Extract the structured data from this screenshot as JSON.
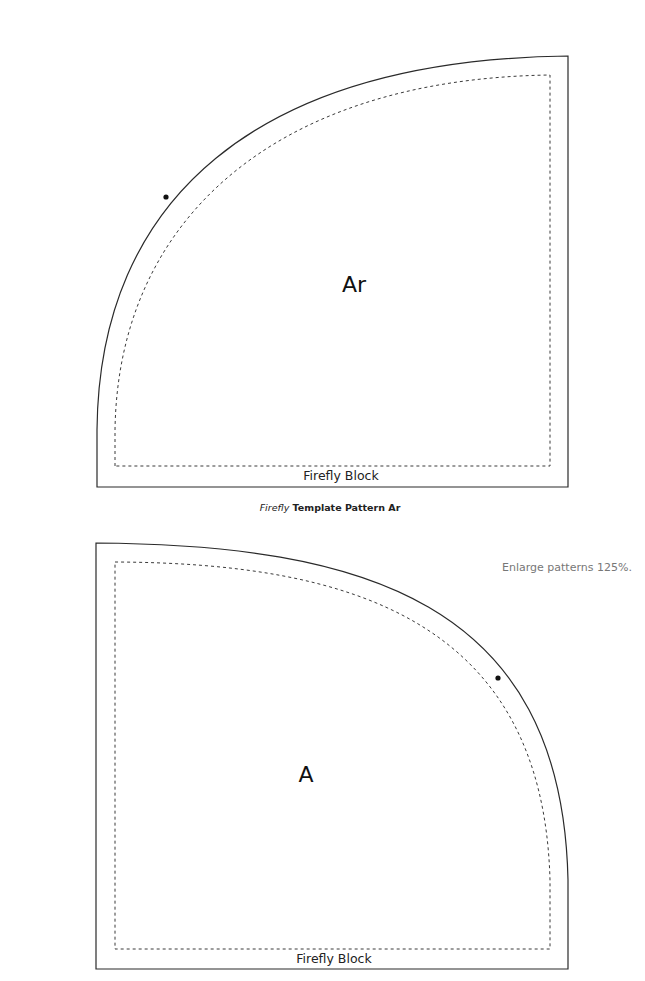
{
  "patterns": [
    {
      "id": "Ar",
      "piece_label": "Ar",
      "block_label": "Firefly Block",
      "caption_italic": "Firefly",
      "caption_rest": " Template Pattern Ar"
    },
    {
      "id": "A",
      "piece_label": "A",
      "block_label": "Firefly Block"
    }
  ],
  "note": "Enlarge patterns 125%.",
  "colors": {
    "outline": "#2a2a2a",
    "seam": "#3a3a3a",
    "note_text": "#777777"
  }
}
